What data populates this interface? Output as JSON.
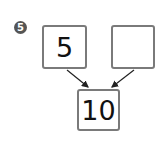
{
  "problem": {
    "number_label": "5",
    "boxes": {
      "top_left": "5",
      "top_right": "",
      "bottom": "10"
    }
  },
  "colors": {
    "box_border": "#7a7a7a",
    "badge": "#555555",
    "arrow": "#222222"
  }
}
